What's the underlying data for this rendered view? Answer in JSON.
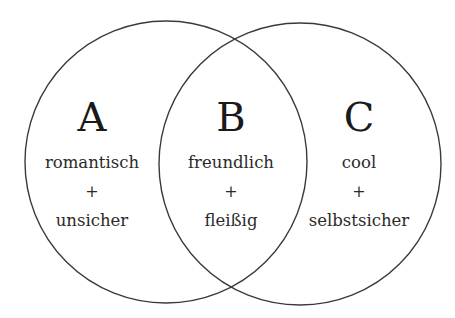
{
  "diagram": {
    "type": "venn",
    "regions": [
      {
        "letter": "A",
        "trait1": "romantisch",
        "joiner": "+",
        "trait2": "unsicher"
      },
      {
        "letter": "B",
        "trait1": "freundlich",
        "joiner": "+",
        "trait2": "fleißig"
      },
      {
        "letter": "C",
        "trait1": "cool",
        "joiner": "+",
        "trait2": "selbstsicher"
      }
    ],
    "colors": {
      "stroke": "#3a3a3a",
      "text": "#1a1a1a",
      "background": "#ffffff"
    }
  }
}
